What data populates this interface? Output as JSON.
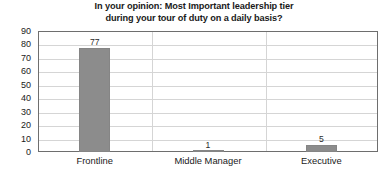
{
  "chart_data": {
    "type": "bar",
    "title": "In your opinion: Most Important leadership tier during your tour of duty on a daily basis?",
    "title_line1": "In your opinion: Most Important leadership tier",
    "title_line2": "during your tour of duty on a daily basis?",
    "categories": [
      "Frontline",
      "Middle Manager",
      "Executive"
    ],
    "values": [
      77,
      1,
      5
    ],
    "data_labels": [
      "77",
      "1",
      "5"
    ],
    "xlabel": "",
    "ylabel": "",
    "ylim": [
      0,
      90
    ],
    "ytick_step": 10,
    "yticks": [
      90,
      80,
      70,
      60,
      50,
      40,
      30,
      20,
      10,
      0
    ],
    "ytick_labels": [
      "90",
      "80",
      "70",
      "60",
      "50",
      "40",
      "30",
      "20",
      "10",
      "0"
    ],
    "grid": {
      "horizontal": true,
      "vertical_category_separators": true
    },
    "legend": null,
    "colors": {
      "bar": "#8c8c8c",
      "bar_border": "#858585",
      "gridline": "#d5d5d5",
      "plot_border": "#6e6e6e",
      "text": "#1a1a1a",
      "background": "#ffffff"
    }
  }
}
